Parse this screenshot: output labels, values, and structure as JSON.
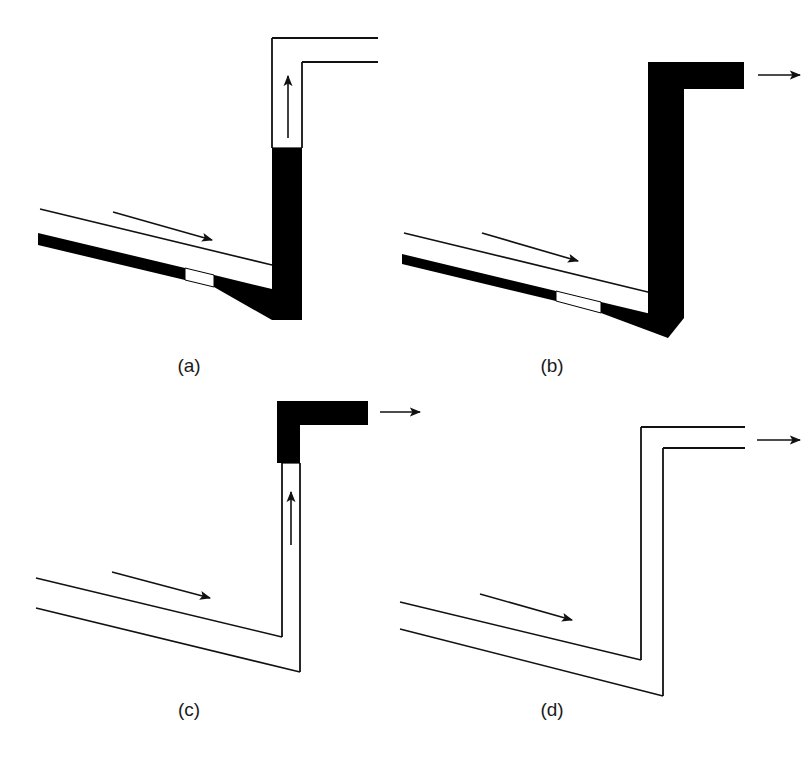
{
  "figure": {
    "title": "",
    "background_color": "#ffffff",
    "ink_color": "#000000",
    "panel_count": 4
  },
  "panels": [
    {
      "id": "a",
      "caption": "(a)",
      "state": "riser partly full, inclined pipe stratified with liquid layer on bottom",
      "riser_style": "outlined-with-fill",
      "riser_fill_level_percent": 62,
      "elbow_style": "outlined",
      "inclined_pipe_style": "outlined-with-bottom-layer",
      "inclined_flow_arrow": "flow-arrow-right",
      "riser_flow_arrow": "flow-arrow-up",
      "outlet_arrow": "none"
    },
    {
      "id": "b",
      "caption": "(b)",
      "state": "riser completely full, liquid discharging from outlet",
      "riser_style": "solid-filled",
      "riser_fill_level_percent": 100,
      "elbow_style": "solid-filled",
      "inclined_pipe_style": "outlined-with-bottom-layer",
      "inclined_flow_arrow": "flow-arrow-right",
      "riser_flow_arrow": "none",
      "outlet_arrow": "flow-arrow-right"
    },
    {
      "id": "c",
      "caption": "(c)",
      "state": "inclined pipe empty, liquid remains only in top elbow, discharging",
      "riser_style": "outlined-with-fill",
      "riser_fill_level_percent": 0,
      "elbow_style": "solid-filled",
      "inclined_pipe_style": "outlined-empty",
      "inclined_flow_arrow": "flow-arrow-right",
      "riser_flow_arrow": "flow-arrow-up",
      "outlet_arrow": "flow-arrow-right"
    },
    {
      "id": "d",
      "caption": "(d)",
      "state": "system completely empty, gas flowing through",
      "riser_style": "outlined-empty",
      "riser_fill_level_percent": 0,
      "elbow_style": "outlined",
      "inclined_pipe_style": "outlined-empty",
      "inclined_flow_arrow": "flow-arrow-right",
      "riser_flow_arrow": "none",
      "outlet_arrow": "flow-arrow-right"
    }
  ],
  "captions": {
    "a": "(a)",
    "b": "(b)",
    "c": "(c)",
    "d": "(d)"
  },
  "icons": {
    "flow_arrow_right": "flow-arrow-right-icon",
    "flow_arrow_up": "flow-arrow-up-icon",
    "outlet_arrow": "outlet-arrow-icon"
  }
}
